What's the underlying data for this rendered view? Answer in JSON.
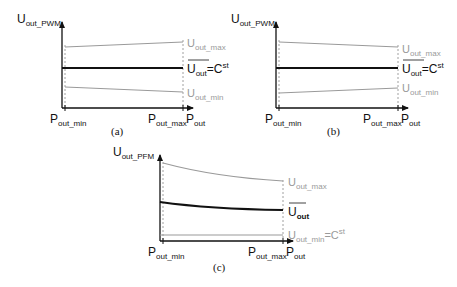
{
  "figure": {
    "panels": [
      {
        "id": "a",
        "caption": "(a)",
        "y_axis_label": {
          "main": "U",
          "sub": "out_PWM"
        },
        "x_axis_label": {
          "main": "P",
          "sub": "out"
        },
        "x_tick_min": {
          "main": "P",
          "sub": "out_min"
        },
        "x_tick_max": {
          "main": "P",
          "sub": "out_max"
        },
        "curves": [
          {
            "name": "U_out_max",
            "label_main": "U",
            "label_sub": "out_max",
            "color": "#9a9a9a",
            "shape": "rising linear"
          },
          {
            "name": "U_out_mean",
            "label_main": "U",
            "label_sub": "out",
            "label_suffix": "=C",
            "label_sup": "st",
            "color": "#111111",
            "shape": "constant",
            "overline": true
          },
          {
            "name": "U_out_min",
            "label_main": "U",
            "label_sub": "out_min",
            "color": "#9a9a9a",
            "shape": "falling linear"
          }
        ]
      },
      {
        "id": "b",
        "caption": "(b)",
        "y_axis_label": {
          "main": "U",
          "sub": "out_PWM"
        },
        "x_axis_label": {
          "main": "P",
          "sub": "out"
        },
        "x_tick_min": {
          "main": "P",
          "sub": "out_min"
        },
        "x_tick_max": {
          "main": "P",
          "sub": "out_max"
        },
        "curves": [
          {
            "name": "U_out_max",
            "label_main": "U",
            "label_sub": "out_max",
            "color": "#9a9a9a",
            "shape": "falling linear"
          },
          {
            "name": "U_out_mean",
            "label_main": "U",
            "label_sub": "out",
            "label_suffix": "=C",
            "label_sup": "st",
            "color": "#111111",
            "shape": "constant",
            "overline": true
          },
          {
            "name": "U_out_min",
            "label_main": "U",
            "label_sub": "out_min",
            "color": "#9a9a9a",
            "shape": "rising linear"
          }
        ]
      },
      {
        "id": "c",
        "caption": "(c)",
        "y_axis_label": {
          "main": "U",
          "sub": "out_PFM"
        },
        "x_axis_label": {
          "main": "P",
          "sub": "out"
        },
        "x_tick_min": {
          "main": "P",
          "sub": "out_min"
        },
        "x_tick_max": {
          "main": "P",
          "sub": "out_max"
        },
        "curves": [
          {
            "name": "U_out_max",
            "label_main": "U",
            "label_sub": "out_max",
            "color": "#9a9a9a",
            "shape": "decaying curve"
          },
          {
            "name": "U_out_mean",
            "label_main": "U",
            "label_sub": "out",
            "color": "#111111",
            "shape": "decaying curve",
            "overline": true
          },
          {
            "name": "U_out_min",
            "label_main": "U",
            "label_sub": "out_min",
            "label_suffix": "=C",
            "label_sup": "st",
            "color": "#9a9a9a",
            "shape": "constant"
          }
        ]
      }
    ]
  }
}
